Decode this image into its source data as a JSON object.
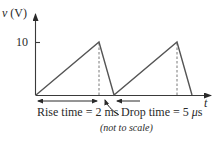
{
  "figure": {
    "y_axis_label_var": "v",
    "y_axis_label_unit": " (V)",
    "x_axis_label": "t",
    "y_tick_label": "10",
    "rise_label": "Rise time = 2 ms",
    "drop_label_prefix": "Drop time = 5 ",
    "drop_label_mu": "μ",
    "drop_label_suffix": "s",
    "note": "(not to scale)"
  },
  "waveform": {
    "type": "sawtooth",
    "peak_voltage": 10,
    "min_voltage": 0,
    "rise_time": "2 ms",
    "drop_time": "5 μs",
    "cycles_shown": 2
  },
  "colors": {
    "line": "#555555",
    "text": "#2a2a2a",
    "background": "#ffffff"
  }
}
